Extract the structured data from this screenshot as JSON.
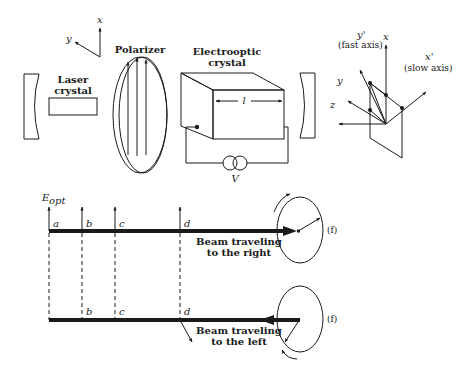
{
  "diagram": {
    "top_axes": {
      "x": "x",
      "y": "y"
    },
    "components": {
      "laser_crystal": "Laser\ncrystal",
      "laser_crystal_l1": "Laser",
      "laser_crystal_l2": "crystal",
      "polarizer": "Polarizer",
      "eo_crystal_l1": "Electrooptic",
      "eo_crystal_l2": "crystal",
      "length_label": "l",
      "voltage_label": "V"
    },
    "crystal_axes": {
      "y_prime": "y'",
      "fast_axis": "(fast axis)",
      "x_prime": "x'",
      "slow_axis": "(slow axis)",
      "x": "x",
      "y": "y",
      "z": "z"
    },
    "field_label": "E",
    "field_subscript": "opt",
    "points": [
      "a",
      "b",
      "c",
      "d"
    ],
    "beam_right": {
      "l1": "Beam traveling",
      "l2": "to the right",
      "end_label": "(f)"
    },
    "beam_left": {
      "l1": "Beam traveling",
      "l2": "to the left",
      "end_label": "(f)"
    }
  }
}
